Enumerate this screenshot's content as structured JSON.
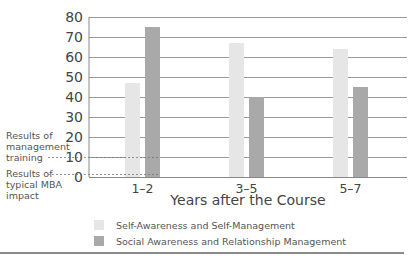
{
  "chart_data": {
    "type": "bar",
    "title": "",
    "xlabel": "Years after the Course",
    "ylabel": "",
    "categories": [
      "1–2",
      "3–5",
      "5–7"
    ],
    "series": [
      {
        "name": "Self-Awareness and Self-Management",
        "values": [
          47,
          67,
          64
        ],
        "color": "#e6e6e6"
      },
      {
        "name": "Social Awareness and Relationship Management",
        "values": [
          75,
          40,
          45
        ],
        "color": "#a9a9a9"
      }
    ],
    "ylim": [
      0,
      80
    ],
    "yticks": [
      0,
      10,
      20,
      30,
      40,
      50,
      60,
      70,
      80
    ],
    "grid": true,
    "legend_position": "bottom-left",
    "annotations": [
      {
        "label": "Results of management training",
        "value": 10,
        "style": "dashed"
      },
      {
        "label": "Results of typical MBA impact",
        "value": 1,
        "style": "dashed"
      }
    ]
  },
  "annotations": {
    "management_training": [
      "Results of",
      "management",
      "training"
    ],
    "mba_impact": [
      "Results of",
      "typical MBA",
      "impact"
    ]
  },
  "legend": {
    "items": [
      {
        "label": "Self-Awareness and Self-Management",
        "color": "#e6e6e6"
      },
      {
        "label": "Social Awareness and Relationship Management",
        "color": "#a9a9a9"
      }
    ]
  },
  "axis": {
    "xlabel": "Years after the Course"
  }
}
